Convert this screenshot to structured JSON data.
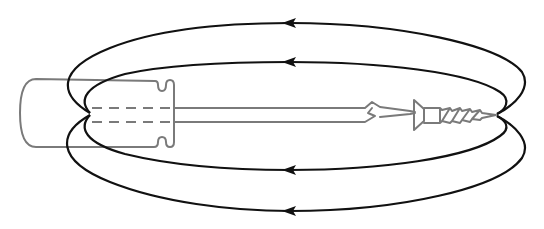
{
  "diagram": {
    "title": "Magnetic field lines around a magnetized screwdriver holding a screw",
    "colors": {
      "background": "#ffffff",
      "field_lines": "#111111",
      "tool_outline": "#7a7a7a"
    },
    "objects": {
      "screwdriver": {
        "parts": [
          "handle",
          "shaft",
          "tip"
        ],
        "handle_style": "rounded outline with finger notches",
        "shaft_inside_handle": "dashed"
      },
      "screw": {
        "parts": [
          "countersunk head",
          "threaded body"
        ]
      }
    },
    "field_lines": [
      {
        "id": "outer-top",
        "arrow_direction": "left"
      },
      {
        "id": "inner-top",
        "arrow_direction": "left"
      },
      {
        "id": "inner-bottom",
        "arrow_direction": "left"
      },
      {
        "id": "outer-bottom",
        "arrow_direction": "left"
      }
    ],
    "field_line_count": 4
  }
}
